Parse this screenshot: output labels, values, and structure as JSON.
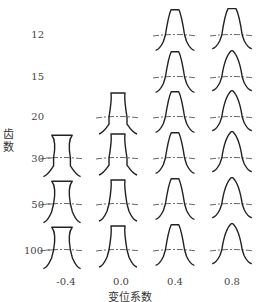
{
  "diagram": {
    "type": "gear tooth profile matrix",
    "y_axis_title": "齿数",
    "x_axis_title": "变位系数",
    "rows": [
      {
        "label": "12",
        "teeth": 12
      },
      {
        "label": "15",
        "teeth": 15
      },
      {
        "label": "20",
        "teeth": 20
      },
      {
        "label": "30",
        "teeth": 30
      },
      {
        "label": "50",
        "teeth": 50
      },
      {
        "label": "100",
        "teeth": 100
      }
    ],
    "columns": [
      {
        "label": "-0.4",
        "shift": -0.4
      },
      {
        "label": "0.0",
        "shift": 0.0
      },
      {
        "label": "0.4",
        "shift": 0.4
      },
      {
        "label": "0.8",
        "shift": 0.8
      }
    ],
    "present": {
      "-0.4": [
        "30",
        "50",
        "100"
      ],
      "0.0": [
        "20",
        "30",
        "50",
        "100"
      ],
      "0.4": [
        "12",
        "15",
        "20",
        "30",
        "50",
        "100"
      ],
      "0.8": [
        "12",
        "15",
        "20",
        "30",
        "50",
        "100"
      ]
    },
    "colors": {
      "profile": "#222222",
      "pitch_line": "#555555",
      "text": "#444444"
    }
  }
}
